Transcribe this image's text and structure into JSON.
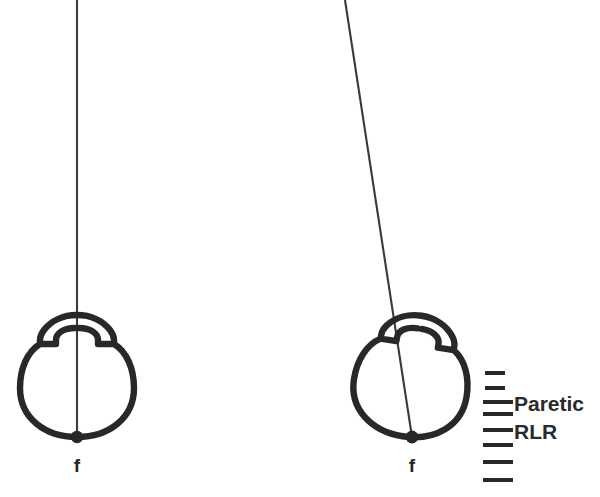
{
  "figure": {
    "background_color": "#ffffff",
    "stroke_color": "#282828",
    "text_color": "#2a2a2a",
    "width": 600,
    "height": 497
  },
  "panels": [
    {
      "id": "left-panel",
      "name": "normal-eye-panel",
      "fovea_label": "f",
      "globe": {
        "center_x": 77,
        "center_y": 377,
        "radius_x": 57,
        "radius_y": 62,
        "rotation_deg": 0
      },
      "meridian_line": {
        "top_x": 77,
        "top_y": 0,
        "bottom_x": 77,
        "bottom_y": 437,
        "tilt_deg": 0
      },
      "fovea_dot": {
        "x": 77,
        "y": 437,
        "radius": 6
      }
    },
    {
      "id": "right-panel",
      "name": "paretic-eye-panel",
      "fovea_label": "f",
      "globe": {
        "center_x": 412,
        "center_y": 377,
        "radius_x": 57,
        "radius_y": 62,
        "rotation_deg": 9
      },
      "meridian_line": {
        "top_x": 345,
        "top_y": 0,
        "bottom_x": 412,
        "bottom_y": 437,
        "tilt_deg": 8.7
      },
      "fovea_dot": {
        "x": 412,
        "y": 437,
        "radius": 6
      }
    }
  ],
  "scale": {
    "name": "muscle-scale-marks",
    "x_start_short": 485,
    "x_end_short": 505,
    "x_start_long": 483,
    "x_end_long": 513,
    "dash_thickness": 4,
    "marks": [
      {
        "index": 0,
        "y": 373,
        "length": "short"
      },
      {
        "index": 1,
        "y": 388,
        "length": "short"
      },
      {
        "index": 2,
        "y": 402,
        "length": "long"
      },
      {
        "index": 3,
        "y": 414,
        "length": "long"
      },
      {
        "index": 4,
        "y": 430,
        "length": "long"
      },
      {
        "index": 5,
        "y": 445,
        "length": "long"
      },
      {
        "index": 6,
        "y": 462,
        "length": "long"
      },
      {
        "index": 7,
        "y": 480,
        "length": "long"
      }
    ],
    "labels": {
      "paretic": "Paretic",
      "rlr": "RLR"
    }
  }
}
